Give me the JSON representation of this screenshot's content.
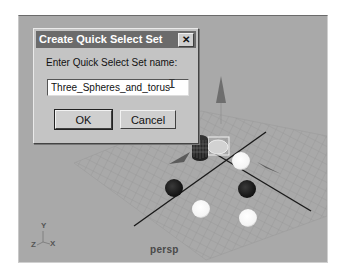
{
  "viewport": {
    "camera_label": "persp",
    "axis_labels": {
      "y": "Y",
      "z": "Z",
      "x": "X"
    },
    "background_color": "#a9a9a9",
    "objects": [
      {
        "type": "torus",
        "label": "torus",
        "state": "selected"
      },
      {
        "type": "cylinder",
        "label": "cylinder",
        "state": "wireframe"
      },
      {
        "type": "cone",
        "label": "cone-left"
      },
      {
        "type": "cone",
        "label": "cone-right"
      },
      {
        "type": "cone",
        "label": "cone-upright"
      },
      {
        "type": "sphere",
        "label": "sphere-white-1",
        "state": "selected"
      },
      {
        "type": "sphere",
        "label": "sphere-white-2",
        "state": "selected"
      },
      {
        "type": "sphere",
        "label": "sphere-white-3",
        "state": "selected"
      },
      {
        "type": "sphere",
        "label": "sphere-dark-1"
      },
      {
        "type": "sphere",
        "label": "sphere-dark-2"
      }
    ]
  },
  "dialog": {
    "title": "Create Quick Select Set",
    "close_glyph": "✕",
    "prompt": "Enter Quick Select Set name:",
    "input_value": "Three_Spheres_and_torus",
    "cursor_glyph": "I",
    "ok_label": "OK",
    "cancel_label": "Cancel"
  }
}
